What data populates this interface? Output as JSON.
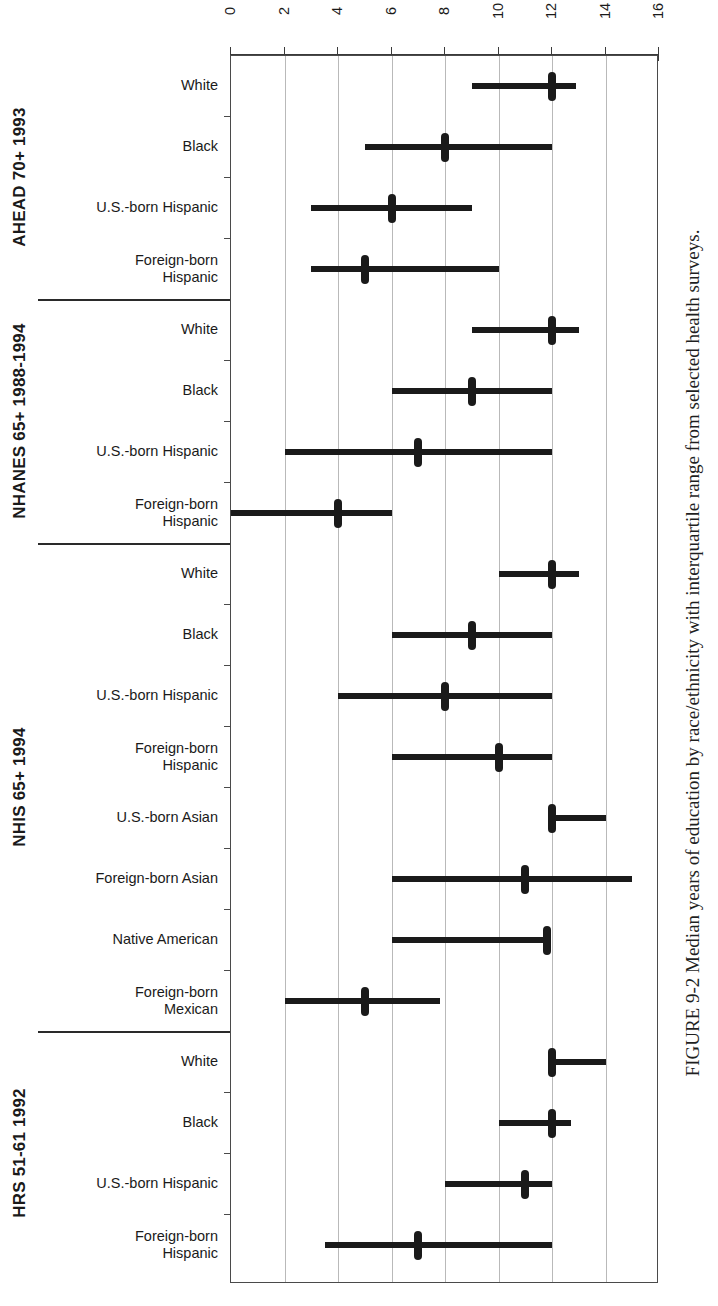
{
  "figure": {
    "caption": "FIGURE 9-2  Median years of education by race/ethnicity with interquartile range from selected health surveys."
  },
  "chart_data": {
    "type": "bar",
    "subtype": "median-with-interquartile-range",
    "title": "FIGURE 9-2  Median years of education by race/ethnicity with interquartile range from selected health surveys.",
    "xlabel": "Years of education",
    "ylabel": "",
    "xlim": [
      0,
      16
    ],
    "xticks": [
      0,
      2,
      4,
      6,
      8,
      10,
      12,
      14,
      16
    ],
    "xtick_labels": [
      "0",
      "2",
      "4",
      "6",
      "8",
      "10",
      "12",
      "14",
      "16"
    ],
    "grid": "vertical",
    "legend": "none",
    "orientation": "horizontal",
    "value_key": "median",
    "range_key": "iqr",
    "groups": [
      {
        "name": "AHEAD 70+ 1993",
        "rows": [
          {
            "label": "White",
            "label_lines": [
              "White"
            ],
            "median": 12.0,
            "iqr": [
              9.0,
              12.9
            ]
          },
          {
            "label": "Black",
            "label_lines": [
              "Black"
            ],
            "median": 8.0,
            "iqr": [
              5.0,
              12.0
            ]
          },
          {
            "label": "U.S.-born Hispanic",
            "label_lines": [
              "U.S.-born Hispanic"
            ],
            "median": 6.0,
            "iqr": [
              3.0,
              9.0
            ]
          },
          {
            "label": "Foreign-born Hispanic",
            "label_lines": [
              "Foreign-born",
              "Hispanic"
            ],
            "median": 5.0,
            "iqr": [
              3.0,
              10.0
            ]
          }
        ]
      },
      {
        "name": "NHANES 65+ 1988-1994",
        "rows": [
          {
            "label": "White",
            "label_lines": [
              "White"
            ],
            "median": 12.0,
            "iqr": [
              9.0,
              13.0
            ]
          },
          {
            "label": "Black",
            "label_lines": [
              "Black"
            ],
            "median": 9.0,
            "iqr": [
              6.0,
              12.0
            ]
          },
          {
            "label": "U.S.-born Hispanic",
            "label_lines": [
              "U.S.-born Hispanic"
            ],
            "median": 7.0,
            "iqr": [
              2.0,
              12.0
            ]
          },
          {
            "label": "Foreign-born Hispanic",
            "label_lines": [
              "Foreign-born",
              "Hispanic"
            ],
            "median": 4.0,
            "iqr": [
              0.0,
              6.0
            ]
          }
        ]
      },
      {
        "name": "NHIS 65+ 1994",
        "rows": [
          {
            "label": "White",
            "label_lines": [
              "White"
            ],
            "median": 12.0,
            "iqr": [
              10.0,
              13.0
            ]
          },
          {
            "label": "Black",
            "label_lines": [
              "Black"
            ],
            "median": 9.0,
            "iqr": [
              6.0,
              12.0
            ]
          },
          {
            "label": "U.S.-born Hispanic",
            "label_lines": [
              "U.S.-born Hispanic"
            ],
            "median": 8.0,
            "iqr": [
              4.0,
              12.0
            ]
          },
          {
            "label": "Foreign-born Hispanic",
            "label_lines": [
              "Foreign-born",
              "Hispanic"
            ],
            "median": 10.0,
            "iqr": [
              6.0,
              12.0
            ]
          },
          {
            "label": "U.S.-born Asian",
            "label_lines": [
              "U.S.-born Asian"
            ],
            "median": 12.0,
            "iqr": [
              12.0,
              14.0
            ]
          },
          {
            "label": "Foreign-born Asian",
            "label_lines": [
              "Foreign-born Asian"
            ],
            "median": 11.0,
            "iqr": [
              6.0,
              15.0
            ]
          },
          {
            "label": "Native American",
            "label_lines": [
              "Native American"
            ],
            "median": 11.8,
            "iqr": [
              6.0,
              11.8
            ]
          },
          {
            "label": "Foreign-born Mexican",
            "label_lines": [
              "Foreign-born",
              "Mexican"
            ],
            "median": 5.0,
            "iqr": [
              2.0,
              7.8
            ]
          }
        ]
      },
      {
        "name": "HRS 51-61 1992",
        "rows": [
          {
            "label": "White",
            "label_lines": [
              "White"
            ],
            "median": 12.0,
            "iqr": [
              12.0,
              14.0
            ]
          },
          {
            "label": "Black",
            "label_lines": [
              "Black"
            ],
            "median": 12.0,
            "iqr": [
              10.0,
              12.7
            ]
          },
          {
            "label": "U.S.-born Hispanic",
            "label_lines": [
              "U.S.-born Hispanic"
            ],
            "median": 11.0,
            "iqr": [
              8.0,
              12.0
            ]
          },
          {
            "label": "Foreign-born Hispanic",
            "label_lines": [
              "Foreign-born",
              "Hispanic"
            ],
            "median": 7.0,
            "iqr": [
              3.5,
              12.0
            ]
          }
        ]
      }
    ]
  }
}
